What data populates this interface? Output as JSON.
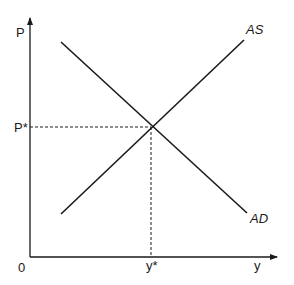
{
  "diagram": {
    "type": "AS-AD equilibrium diagram",
    "axes": {
      "y_label": "P",
      "x_label": "y",
      "origin_label": "0"
    },
    "curves": [
      {
        "name": "AS",
        "label": "AS",
        "slope": "upward"
      },
      {
        "name": "AD",
        "label": "AD",
        "slope": "downward"
      }
    ],
    "equilibrium": {
      "price_label": "P*",
      "output_label": "y*"
    },
    "colors": {
      "line": "#1a1a1a",
      "background": "#ffffff"
    }
  }
}
